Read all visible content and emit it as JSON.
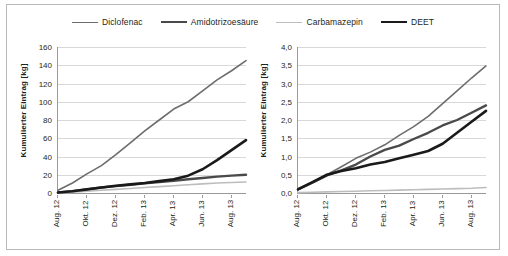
{
  "legend": {
    "position": "top-center",
    "items": [
      {
        "label": "Diclofenac",
        "color": "#6d6d6d",
        "width": 1.6
      },
      {
        "label": "Amidotrizoesäure",
        "color": "#4a4a4a",
        "width": 2.4
      },
      {
        "label": "Carbamazepin",
        "color": "#bdbdbd",
        "width": 1.6
      },
      {
        "label": "DEET",
        "color": "#1a1a1a",
        "width": 2.6
      }
    ]
  },
  "chart_data": [
    {
      "type": "line",
      "title": "",
      "xlabel": "",
      "ylabel": "Kumulierter Eintrag [kg]",
      "grid": true,
      "ylim": [
        0,
        160
      ],
      "yticks": [
        "0",
        "20",
        "40",
        "60",
        "80",
        "100",
        "120",
        "140",
        "160"
      ],
      "ytick_values": [
        0,
        20,
        40,
        60,
        80,
        100,
        120,
        140,
        160
      ],
      "categories": [
        "Aug. 12",
        "Okt. 12",
        "Dez. 12",
        "Feb. 13",
        "Apr. 13",
        "Jun. 13",
        "Aug. 13"
      ],
      "x": [
        0,
        1,
        2,
        3,
        4,
        5,
        6,
        7,
        8,
        9,
        10,
        11,
        12,
        13
      ],
      "xlim": [
        0,
        13
      ],
      "series": [
        {
          "name": "Diclofenac",
          "color": "#6d6d6d",
          "width": 1.6,
          "values": [
            3,
            11,
            21,
            30,
            42,
            55,
            68,
            80,
            92,
            100,
            112,
            124,
            134,
            145
          ]
        },
        {
          "name": "Amidotrizoesäure",
          "color": "#4a4a4a",
          "width": 2.4,
          "values": [
            0.5,
            2,
            4,
            6,
            7.5,
            9,
            10.5,
            12,
            13.5,
            15,
            16.5,
            18,
            19,
            20
          ]
        },
        {
          "name": "Carbamazepin",
          "color": "#bdbdbd",
          "width": 1.6,
          "values": [
            0.3,
            1,
            2,
            3,
            4,
            5,
            6,
            7,
            8,
            9,
            10,
            11,
            11.5,
            12
          ]
        },
        {
          "name": "DEET",
          "color": "#1a1a1a",
          "width": 2.6,
          "values": [
            0.5,
            2,
            4,
            6,
            8,
            9.5,
            11,
            13,
            15,
            19,
            26,
            36,
            47,
            58
          ]
        }
      ]
    },
    {
      "type": "line",
      "title": "",
      "xlabel": "",
      "ylabel": "Kumulierter Eintrag [kg]",
      "grid": true,
      "ylim": [
        0,
        4
      ],
      "yticks": [
        "0,0",
        "0,5",
        "1,0",
        "1,5",
        "2,0",
        "2,5",
        "3,0",
        "3,5",
        "4,0"
      ],
      "ytick_values": [
        0,
        0.5,
        1,
        1.5,
        2,
        2.5,
        3,
        3.5,
        4
      ],
      "categories": [
        "Aug. 12",
        "Okt. 12",
        "Dez. 12",
        "Feb. 13",
        "Apr. 13",
        "Jun. 13",
        "Aug. 13"
      ],
      "x": [
        0,
        1,
        2,
        3,
        4,
        5,
        6,
        7,
        8,
        9,
        10,
        11,
        12,
        13
      ],
      "xlim": [
        0,
        13
      ],
      "series": [
        {
          "name": "Diclofenac",
          "color": "#6d6d6d",
          "width": 1.6,
          "values": [
            0.12,
            0.3,
            0.5,
            0.72,
            0.95,
            1.12,
            1.32,
            1.58,
            1.82,
            2.1,
            2.45,
            2.8,
            3.15,
            3.48
          ]
        },
        {
          "name": "Amidotrizoesäure",
          "color": "#4a4a4a",
          "width": 2.4,
          "values": [
            0.1,
            0.28,
            0.48,
            0.62,
            0.78,
            1.0,
            1.18,
            1.3,
            1.48,
            1.65,
            1.85,
            2.0,
            2.2,
            2.4
          ]
        },
        {
          "name": "Carbamazepin",
          "color": "#bdbdbd",
          "width": 1.6,
          "values": [
            0.01,
            0.02,
            0.03,
            0.04,
            0.05,
            0.06,
            0.07,
            0.08,
            0.09,
            0.1,
            0.11,
            0.12,
            0.13,
            0.15
          ]
        },
        {
          "name": "DEET",
          "color": "#1a1a1a",
          "width": 2.6,
          "values": [
            0.1,
            0.3,
            0.5,
            0.6,
            0.68,
            0.78,
            0.85,
            0.95,
            1.05,
            1.15,
            1.35,
            1.65,
            1.95,
            2.25
          ]
        }
      ]
    }
  ]
}
